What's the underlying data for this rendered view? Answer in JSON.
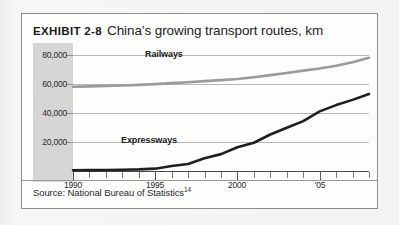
{
  "exhibit": {
    "tag": "EXHIBIT 2-8",
    "title": "China’s growing transport routes, km"
  },
  "source": {
    "text": "Source: National Bureau of Statistics",
    "footnote": "14"
  },
  "chart_data": {
    "type": "line",
    "title": "China’s growing transport routes, km",
    "xlabel": "",
    "ylabel": "km",
    "xlim": [
      1990,
      2008
    ],
    "ylim": [
      0,
      88000
    ],
    "grid": true,
    "legend": "inline-labels",
    "ytick_labels": [
      "20,000",
      "40,000",
      "60,000",
      "80,000"
    ],
    "ytick_values": [
      20000,
      40000,
      60000,
      80000
    ],
    "xtick_labels": [
      "1990",
      "1995",
      "2000",
      "'05"
    ],
    "xtick_values": [
      1990,
      1995,
      2000,
      2005
    ],
    "x": [
      1990,
      1991,
      1992,
      1993,
      1994,
      1995,
      1996,
      1997,
      1998,
      1999,
      2000,
      2001,
      2002,
      2003,
      2004,
      2005,
      2006,
      2007,
      2008
    ],
    "series": [
      {
        "name": "Railways",
        "color": "#9b9b9b",
        "values": [
          57900,
          58200,
          58500,
          58800,
          59200,
          59700,
          60400,
          61000,
          61800,
          62500,
          63300,
          64500,
          65900,
          67400,
          69000,
          70500,
          72300,
          74800,
          77800
        ]
      },
      {
        "name": "Expressways",
        "color": "#1f1f1f",
        "values": [
          500,
          600,
          700,
          900,
          1100,
          1600,
          3400,
          4800,
          8700,
          11600,
          16300,
          19400,
          25100,
          29700,
          34300,
          41000,
          45300,
          48900,
          53000
        ]
      }
    ]
  },
  "colors": {
    "railways": "#9b9b9b",
    "expressways": "#1f1f1f",
    "gridline": "#b9b9b9",
    "axis": "#4a4a4a",
    "axis_shade": "#d6d6d6",
    "frame": "#8c8c8c",
    "page_background": "#f2f2f1"
  }
}
